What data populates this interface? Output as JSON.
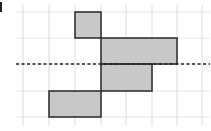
{
  "figure": {
    "grid": {
      "vertical_lines_x": [
        23,
        49,
        75,
        101,
        126,
        152,
        177,
        202
      ],
      "horizontal_lines_y": [
        12,
        38,
        64,
        91,
        117
      ],
      "x_extent": [
        16,
        210
      ],
      "y_extent": [
        5,
        126
      ],
      "line_color": "#e6e6e6"
    },
    "shaded_rects": [
      {
        "x": 75,
        "y": 12,
        "w": 26,
        "h": 26
      },
      {
        "x": 101,
        "y": 38,
        "w": 76,
        "h": 26
      },
      {
        "x": 101,
        "y": 64,
        "w": 51,
        "h": 27
      },
      {
        "x": 49,
        "y": 91,
        "w": 52,
        "h": 26
      }
    ],
    "outline_path": "M75 12 L101 12 L101 38 L177 38 L177 64 L152 64 L152 91 L101 91 L101 117 L49 117 L49 91 L101 91 L101 38 L75 38 Z",
    "fill_color": "#c8c8c8",
    "stroke_color": "#333333",
    "dashed_line": {
      "x1": 16,
      "x2": 210,
      "y": 64,
      "color": "#222222"
    }
  }
}
